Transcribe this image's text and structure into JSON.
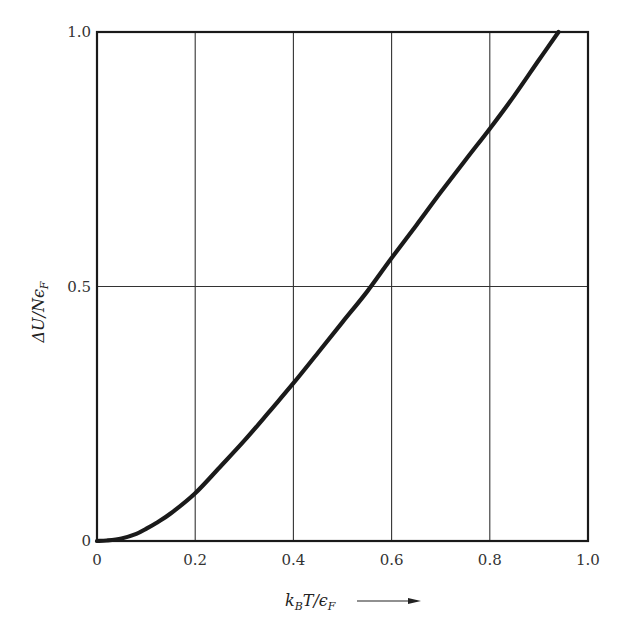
{
  "chart_data": {
    "type": "line",
    "title": "",
    "xlabel": "k_B T/ε_F",
    "ylabel": "ΔU/Nε_F",
    "xlabel_display": {
      "k": "k",
      "sub_k": "B",
      "mid": "T/",
      "eps": "ϵ",
      "sub_eps": "F"
    },
    "ylabel_display": {
      "main": "ΔU/Nϵ",
      "sub": "F"
    },
    "xlim": [
      0,
      1.0
    ],
    "ylim": [
      0,
      1.0
    ],
    "x_ticks": [
      "0",
      "0.2",
      "0.4",
      "0.6",
      "0.8",
      "1.0"
    ],
    "y_ticks": [
      "0",
      "0.5",
      "1.0"
    ],
    "grid": true,
    "grid_x": [
      0.2,
      0.4,
      0.6,
      0.8
    ],
    "grid_y": [
      0.5
    ],
    "legend": null,
    "x_axis_arrow": true,
    "series": [
      {
        "name": "ΔU/Nε_F",
        "color": "#1a1a1a",
        "x": [
          0.0,
          0.02,
          0.05,
          0.08,
          0.1,
          0.12,
          0.15,
          0.2,
          0.25,
          0.3,
          0.35,
          0.4,
          0.45,
          0.5,
          0.55,
          0.6,
          0.65,
          0.7,
          0.75,
          0.8,
          0.85,
          0.9,
          0.94
        ],
        "y": [
          0.0,
          0.001,
          0.005,
          0.014,
          0.024,
          0.035,
          0.054,
          0.094,
          0.145,
          0.197,
          0.253,
          0.31,
          0.37,
          0.43,
          0.49,
          0.556,
          0.62,
          0.685,
          0.748,
          0.81,
          0.875,
          0.945,
          1.0
        ]
      }
    ]
  }
}
